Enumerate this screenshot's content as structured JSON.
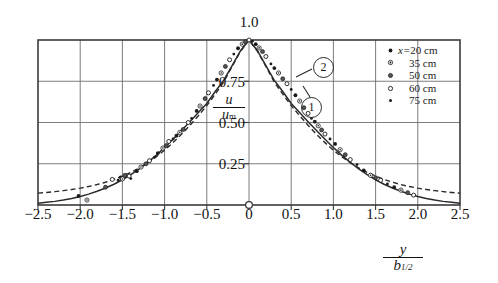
{
  "figure": {
    "title": "",
    "background": "#ffffff",
    "line_color": "#2b2b2b",
    "grid_color": "#6e6e6e"
  },
  "axes": {
    "x_label_num": "y",
    "x_label_den": "b",
    "x_label_den_sub": "1/2",
    "y_label_num": "u",
    "y_label_den": "u",
    "y_label_den_sub": "m",
    "x_ticks": [
      "−2.5",
      "−2.0",
      "−1.5",
      "−1.0",
      "−0.5",
      "0",
      "0.5",
      "1.0",
      "1.5",
      "2.0",
      "2.5"
    ],
    "x_tick_values": [
      -2.5,
      -2.0,
      -1.5,
      -1.0,
      -0.5,
      0,
      0.5,
      1.0,
      1.5,
      2.0,
      2.5
    ],
    "y_ticks": [
      "0.25",
      "0.50",
      "0.75"
    ],
    "y_tick_values": [
      0.25,
      0.5,
      0.75
    ],
    "peak_label": "1.0",
    "peak_label_value": 1.0,
    "origin_marker": "open-circle"
  },
  "legend": {
    "entries": [
      {
        "label_prefix": "x=",
        "label": "20 cm",
        "marker": "filled-dot"
      },
      {
        "label_prefix": "",
        "label": "35 cm",
        "marker": "dot-in-circle"
      },
      {
        "label_prefix": "",
        "label": "50 cm",
        "marker": "half-filled-circle"
      },
      {
        "label_prefix": "",
        "label": "60 cm",
        "marker": "open-circle"
      },
      {
        "label_prefix": "",
        "label": "75 cm",
        "marker": "small-filled-dot"
      }
    ]
  },
  "annotations": [
    {
      "name": "curve-callout-2",
      "text": "2",
      "x_px": 322,
      "y_px": 66
    },
    {
      "name": "curve-callout-1",
      "text": "1",
      "x_px": 310,
      "y_px": 106
    }
  ],
  "chart_data": {
    "type": "scatter",
    "title": "",
    "xlabel": "y / b_1/2",
    "ylabel": "u / u_m",
    "xlim": [
      -2.5,
      2.5
    ],
    "ylim": [
      0.0,
      1.0
    ],
    "grid": true,
    "grid_x": [
      -2.5,
      -2.0,
      -1.5,
      -1.0,
      -0.5,
      0,
      0.5,
      1.0,
      1.5,
      2.0,
      2.5
    ],
    "grid_y": [
      0.0,
      0.25,
      0.5,
      0.75,
      1.0
    ],
    "legend_position": "top-right-inside",
    "series": [
      {
        "name": "curve-1-solid",
        "label": "1",
        "type": "line",
        "style": "solid",
        "comment": "u/u_m = sech^2(0.8814 * eta) type profile, reaches ~0 at |eta|=2.5",
        "x": [
          -2.5,
          -2.4,
          -2.3,
          -2.2,
          -2.1,
          -2.0,
          -1.9,
          -1.8,
          -1.7,
          -1.6,
          -1.5,
          -1.4,
          -1.3,
          -1.2,
          -1.1,
          -1.0,
          -0.9,
          -0.8,
          -0.7,
          -0.6,
          -0.5,
          -0.4,
          -0.3,
          -0.2,
          -0.1,
          0,
          0.1,
          0.2,
          0.3,
          0.4,
          0.5,
          0.6,
          0.7,
          0.8,
          0.9,
          1.0,
          1.1,
          1.2,
          1.3,
          1.4,
          1.5,
          1.6,
          1.7,
          1.8,
          1.9,
          2.0,
          2.1,
          2.2,
          2.3,
          2.4,
          2.5
        ],
        "y": [
          0.01,
          0.016,
          0.022,
          0.03,
          0.04,
          0.052,
          0.066,
          0.083,
          0.103,
          0.126,
          0.153,
          0.184,
          0.219,
          0.258,
          0.301,
          0.348,
          0.398,
          0.451,
          0.505,
          0.56,
          0.615,
          0.688,
          0.755,
          0.845,
          0.935,
          1.0,
          0.935,
          0.845,
          0.755,
          0.688,
          0.615,
          0.56,
          0.505,
          0.451,
          0.398,
          0.348,
          0.301,
          0.258,
          0.219,
          0.184,
          0.153,
          0.126,
          0.103,
          0.083,
          0.066,
          0.052,
          0.04,
          0.03,
          0.022,
          0.016,
          0.01
        ]
      },
      {
        "name": "curve-2-dashed",
        "label": "2",
        "type": "line",
        "style": "dashed",
        "comment": "Gaussian-like profile with broader tails, ~0.07 at |eta|=2.5",
        "x": [
          -2.5,
          -2.4,
          -2.3,
          -2.2,
          -2.1,
          -2.0,
          -1.9,
          -1.8,
          -1.7,
          -1.6,
          -1.5,
          -1.4,
          -1.3,
          -1.2,
          -1.1,
          -1.0,
          -0.9,
          -0.8,
          -0.7,
          -0.6,
          -0.5,
          -0.4,
          -0.3,
          -0.2,
          -0.1,
          0,
          0.1,
          0.2,
          0.3,
          0.4,
          0.5,
          0.6,
          0.7,
          0.8,
          0.9,
          1.0,
          1.1,
          1.2,
          1.3,
          1.4,
          1.5,
          1.6,
          1.7,
          1.8,
          1.9,
          2.0,
          2.1,
          2.2,
          2.3,
          2.4,
          2.5
        ],
        "y": [
          0.072,
          0.076,
          0.081,
          0.087,
          0.094,
          0.102,
          0.112,
          0.124,
          0.138,
          0.155,
          0.175,
          0.198,
          0.225,
          0.256,
          0.292,
          0.332,
          0.378,
          0.428,
          0.483,
          0.541,
          0.602,
          0.672,
          0.745,
          0.84,
          0.932,
          1.0,
          0.932,
          0.84,
          0.745,
          0.672,
          0.602,
          0.541,
          0.483,
          0.428,
          0.378,
          0.332,
          0.292,
          0.256,
          0.225,
          0.198,
          0.175,
          0.155,
          0.138,
          0.124,
          0.112,
          0.102,
          0.094,
          0.087,
          0.081,
          0.076,
          0.072
        ]
      },
      {
        "name": "measured-points",
        "label": "measured data (x = 20, 35, 50, 60, 75 cm)",
        "type": "scatter",
        "x": [
          -2.02,
          -1.92,
          -1.7,
          -1.62,
          -1.55,
          -1.52,
          -1.5,
          -1.47,
          -1.42,
          -1.4,
          -1.33,
          -1.28,
          -1.22,
          -1.18,
          -1.12,
          -1.08,
          -1.02,
          -0.98,
          -0.95,
          -0.9,
          -0.86,
          -0.82,
          -0.78,
          -0.72,
          -0.68,
          -0.62,
          -0.58,
          -0.52,
          -0.48,
          -0.42,
          -0.38,
          -0.33,
          -0.28,
          -0.23,
          -0.18,
          -0.13,
          -0.08,
          -0.04,
          0.0,
          0.04,
          0.08,
          0.12,
          0.16,
          0.2,
          0.26,
          0.3,
          0.35,
          0.4,
          0.45,
          0.5,
          0.55,
          0.6,
          0.65,
          0.7,
          0.74,
          0.78,
          0.82,
          0.86,
          0.9,
          0.96,
          1.02,
          1.08,
          1.14,
          1.2,
          1.28,
          1.36,
          1.44,
          1.5,
          1.56,
          1.64,
          1.72,
          1.8,
          1.88,
          1.95
        ],
        "y": [
          0.055,
          0.03,
          0.108,
          0.155,
          0.15,
          0.168,
          0.158,
          0.18,
          0.175,
          0.16,
          0.205,
          0.23,
          0.25,
          0.268,
          0.29,
          0.315,
          0.345,
          0.36,
          0.385,
          0.4,
          0.42,
          0.44,
          0.458,
          0.5,
          0.525,
          0.57,
          0.6,
          0.645,
          0.68,
          0.725,
          0.76,
          0.8,
          0.84,
          0.88,
          0.915,
          0.95,
          0.975,
          0.99,
          1.0,
          0.992,
          0.975,
          0.952,
          0.93,
          0.9,
          0.855,
          0.83,
          0.8,
          0.765,
          0.735,
          0.7,
          0.665,
          0.63,
          0.59,
          0.555,
          0.525,
          0.505,
          0.48,
          0.455,
          0.43,
          0.4,
          0.37,
          0.335,
          0.305,
          0.275,
          0.245,
          0.21,
          0.18,
          0.165,
          0.15,
          0.128,
          0.108,
          0.09,
          0.075,
          0.06
        ]
      }
    ]
  }
}
